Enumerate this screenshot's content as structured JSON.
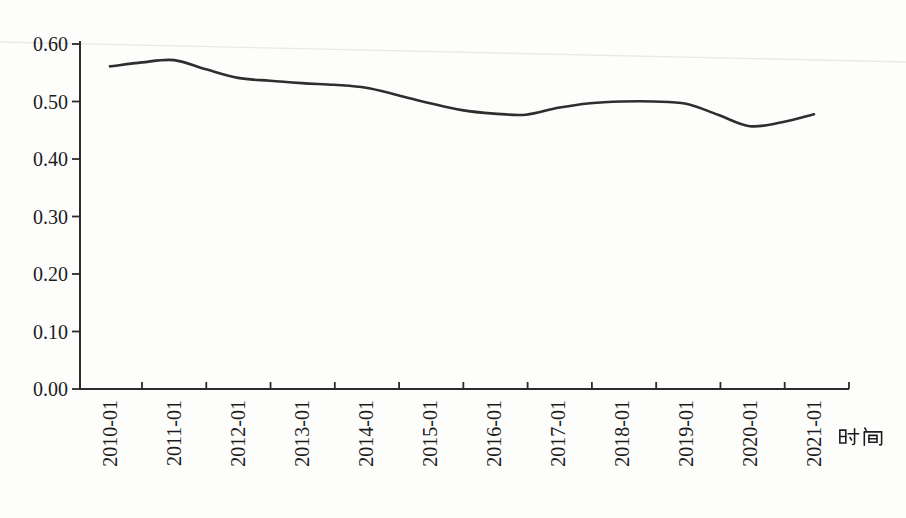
{
  "page": {
    "background_color": "#fdfdfc",
    "artifact_line_color": "#e9e9e6"
  },
  "xaxis": {
    "title": "时间"
  },
  "chart_data": {
    "type": "line",
    "title": "",
    "xlabel": "时间",
    "ylabel": "",
    "ylim": [
      0,
      0.6
    ],
    "y_tick_step": 0.1,
    "grid": false,
    "legend": "none",
    "axis_color": "#2b2b2b",
    "line_color": "#2e2e2e",
    "label_color": "#1c1c1c",
    "x_tick_labels": [
      "2010-01",
      "2011-01",
      "2012-01",
      "2013-01",
      "2014-01",
      "2015-01",
      "2016-01",
      "2017-01",
      "2018-01",
      "2019-01",
      "2020-01",
      "2021-01"
    ],
    "y_tick_labels": [
      "0.00",
      "0.10",
      "0.20",
      "0.30",
      "0.40",
      "0.50",
      "0.60"
    ],
    "series": [
      {
        "name": "value",
        "x": [
          "2010-01",
          "2010-07",
          "2011-01",
          "2011-07",
          "2012-01",
          "2012-07",
          "2013-01",
          "2013-07",
          "2014-01",
          "2014-07",
          "2015-01",
          "2015-07",
          "2016-01",
          "2016-07",
          "2017-01",
          "2017-07",
          "2018-01",
          "2018-07",
          "2019-01",
          "2019-07",
          "2020-01",
          "2020-07",
          "2021-01"
        ],
        "values": [
          0.561,
          0.568,
          0.572,
          0.556,
          0.541,
          0.536,
          0.532,
          0.529,
          0.524,
          0.511,
          0.497,
          0.485,
          0.479,
          0.477,
          0.489,
          0.497,
          0.5,
          0.5,
          0.496,
          0.477,
          0.457,
          0.464,
          0.478
        ]
      }
    ]
  }
}
